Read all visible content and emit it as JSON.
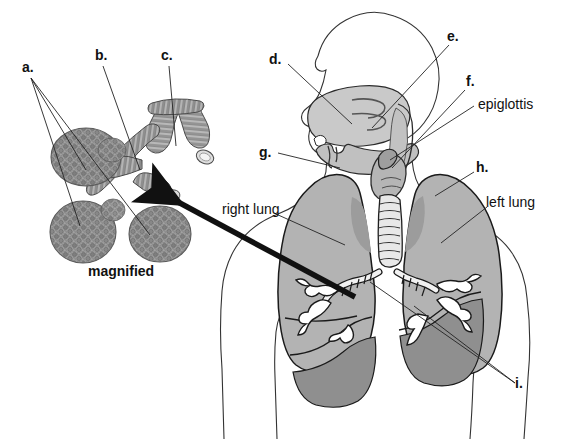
{
  "figure": {
    "background_color": "#ffffff",
    "ink_color": "#1a1a1a"
  },
  "colors": {
    "lung_fill": "#b3b3b3",
    "lung_lower_lobe": "#8f8f8f",
    "lung_shadow": "#9a9a9a",
    "airway_fill": "#c9c9c9",
    "airway_dark": "#8d8d8d",
    "alveoli_gray": "#8c8c8c",
    "bronchiole_gray": "#9d9d9d",
    "arrow_black": "#111111",
    "line_color": "#222222"
  },
  "inset": {
    "caption": "magnified",
    "labels": [
      {
        "id": "a",
        "text": "a.",
        "x": 22,
        "y": 72
      },
      {
        "id": "b",
        "text": "b.",
        "x": 98,
        "y": 60
      },
      {
        "id": "c",
        "text": "c.",
        "x": 164,
        "y": 60
      }
    ]
  },
  "main": {
    "labels": [
      {
        "id": "d",
        "text": "d.",
        "x": 272,
        "y": 60
      },
      {
        "id": "e",
        "text": "e.",
        "x": 450,
        "y": 37
      },
      {
        "id": "f",
        "text": "f.",
        "x": 468,
        "y": 82
      },
      {
        "id": "epiglottis",
        "text": "epiglottis",
        "x": 478,
        "y": 104
      },
      {
        "id": "g",
        "text": "g.",
        "x": 262,
        "y": 152
      },
      {
        "id": "h",
        "text": "h.",
        "x": 478,
        "y": 168
      },
      {
        "id": "right_lung",
        "text": "right lung",
        "x": 224,
        "y": 210
      },
      {
        "id": "left_lung",
        "text": "left lung",
        "x": 489,
        "y": 202
      },
      {
        "id": "i",
        "text": "i.",
        "x": 518,
        "y": 388
      }
    ]
  },
  "legend_keys": {
    "a": "alveoli",
    "b": "alveolar duct",
    "c": "bronchiole",
    "d": "nasal cavity",
    "e": "pharynx",
    "f": "larynx",
    "g": "tongue",
    "h": "trachea",
    "i": "bronchus"
  }
}
